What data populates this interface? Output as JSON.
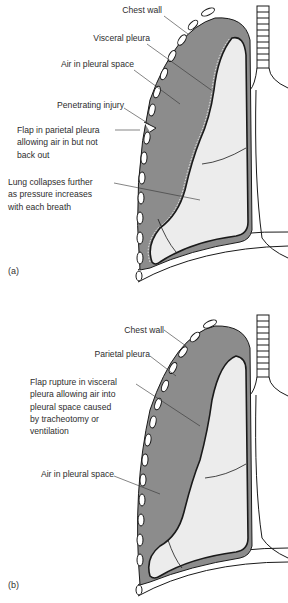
{
  "figure": {
    "colors": {
      "pleural_air": "#8c8c8c",
      "lung": "#ececec",
      "outline": "#1a1a1a",
      "background": "#ffffff",
      "text": "#2d2d2d"
    },
    "panels": [
      {
        "tag": "(a)",
        "labels": {
          "chest_wall": "Chest wall",
          "visceral_pleura": "Visceral pleura",
          "air_pleural_space": "Air in pleural space",
          "penetrating_injury": "Penetrating injury",
          "flap_parietal": "Flap in parietal pleura\nallowing air in but not\nback out",
          "lung_collapses": "Lung collapses further\nas pressure increases\nwith each breath"
        }
      },
      {
        "tag": "(b)",
        "labels": {
          "chest_wall": "Chest wall",
          "parietal_pleura": "Parietal pleura",
          "flap_visceral": "Flap rupture in visceral\npleura allowing air into\npleural space caused\nby tracheotomy or\nventilation",
          "air_pleural_space": "Air in pleural space"
        }
      }
    ]
  }
}
